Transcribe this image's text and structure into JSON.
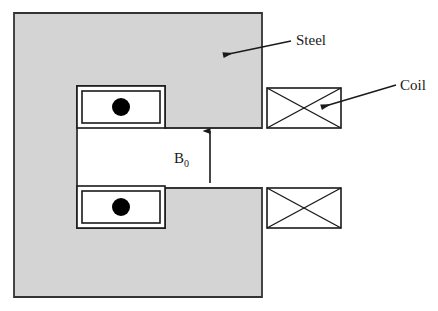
{
  "figure": {
    "background_color": "#ffffff"
  },
  "colors": {
    "steel_fill": "#d4d4d4",
    "steel_stroke": "#333333",
    "coil_fill": "#ffffff",
    "coil_stroke": "#1a1a1a",
    "pole_dot": "#000000",
    "leader_line": "#1a1a1a",
    "text": "#1a1a1a"
  },
  "steel_core": {
    "name": "Steel",
    "fill": "#d4d4d4",
    "outline": {
      "x": 14,
      "y": 13,
      "width": 248,
      "height": 284
    }
  },
  "air_gap": {
    "field_label": "B",
    "field_subscript": "0",
    "arrow_direction": "up",
    "arrow_x": 210,
    "arrow_top_y": 130,
    "arrow_bottom_y": 183
  },
  "pole_pieces": [
    {
      "position": "upper",
      "outer": {
        "x": 77,
        "y": 86,
        "width": 88,
        "height": 42
      },
      "inner": {
        "x": 82,
        "y": 91,
        "width": 78,
        "height": 32
      },
      "dot": {
        "cx": 121,
        "cy": 107,
        "r": 9
      }
    },
    {
      "position": "lower",
      "outer": {
        "x": 77,
        "y": 186,
        "width": 88,
        "height": 42
      },
      "inner": {
        "x": 82,
        "y": 191,
        "width": 78,
        "height": 32
      },
      "dot": {
        "cx": 121,
        "cy": 207,
        "r": 9
      }
    }
  ],
  "coils": [
    {
      "position": "upper",
      "label": "Coil",
      "box": {
        "x": 267,
        "y": 88,
        "width": 74,
        "height": 40
      }
    },
    {
      "position": "lower",
      "label": "Coil",
      "box": {
        "x": 267,
        "y": 188,
        "width": 74,
        "height": 40
      }
    }
  ],
  "annotations": [
    {
      "id": "steel-label",
      "text": "Steel",
      "text_x": 296,
      "text_y": 45,
      "leader_from_x": 291,
      "leader_from_y": 41,
      "leader_to_x": 222,
      "leader_to_y": 55
    },
    {
      "id": "coil-label",
      "text": "Coil",
      "text_x": 400,
      "text_y": 90,
      "leader_from_x": 396,
      "leader_from_y": 85,
      "leader_to_x": 320,
      "leader_to_y": 108
    }
  ]
}
